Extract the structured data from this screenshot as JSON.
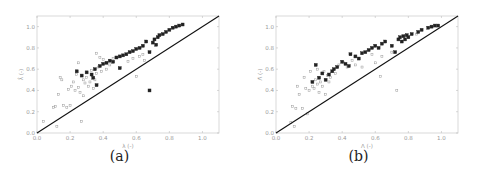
{
  "chart_data": [
    {
      "type": "scatter",
      "panel": "a",
      "caption": "(a)",
      "title": "",
      "xlabel": "λ (-)",
      "ylabel": "λ̂ (-)",
      "xlim": [
        0.0,
        1.1
      ],
      "ylim": [
        0.0,
        1.1
      ],
      "xticks": [
        "0.0",
        "0.2",
        "0.4",
        "0.6",
        "0.8",
        "1.0"
      ],
      "yticks": [
        "0.0",
        "0.2",
        "0.4",
        "0.6",
        "0.8",
        "1.0"
      ],
      "grid": false,
      "reference_line": {
        "type": "identity",
        "from": [
          0,
          0
        ],
        "to": [
          1.1,
          1.1
        ]
      },
      "series": [
        {
          "name": "dark",
          "color": "#222222",
          "points": [
            [
              0.24,
              0.58
            ],
            [
              0.27,
              0.54
            ],
            [
              0.3,
              0.57
            ],
            [
              0.33,
              0.55
            ],
            [
              0.34,
              0.52
            ],
            [
              0.35,
              0.6
            ],
            [
              0.36,
              0.45
            ],
            [
              0.38,
              0.63
            ],
            [
              0.4,
              0.65
            ],
            [
              0.42,
              0.66
            ],
            [
              0.44,
              0.68
            ],
            [
              0.46,
              0.67
            ],
            [
              0.48,
              0.71
            ],
            [
              0.5,
              0.72
            ],
            [
              0.5,
              0.61
            ],
            [
              0.52,
              0.73
            ],
            [
              0.54,
              0.74
            ],
            [
              0.56,
              0.76
            ],
            [
              0.58,
              0.77
            ],
            [
              0.6,
              0.79
            ],
            [
              0.62,
              0.8
            ],
            [
              0.64,
              0.82
            ],
            [
              0.66,
              0.86
            ],
            [
              0.68,
              0.76
            ],
            [
              0.68,
              0.4
            ],
            [
              0.7,
              0.85
            ],
            [
              0.71,
              0.88
            ],
            [
              0.72,
              0.83
            ],
            [
              0.73,
              0.9
            ],
            [
              0.74,
              0.92
            ],
            [
              0.76,
              0.93
            ],
            [
              0.78,
              0.95
            ],
            [
              0.8,
              0.97
            ],
            [
              0.82,
              0.99
            ],
            [
              0.84,
              1.0
            ],
            [
              0.86,
              1.01
            ],
            [
              0.88,
              1.02
            ]
          ]
        },
        {
          "name": "light",
          "color": "#9a9a9a",
          "points": [
            [
              0.04,
              0.11
            ],
            [
              0.1,
              0.24
            ],
            [
              0.11,
              0.25
            ],
            [
              0.12,
              0.06
            ],
            [
              0.13,
              0.36
            ],
            [
              0.14,
              0.52
            ],
            [
              0.15,
              0.5
            ],
            [
              0.16,
              0.26
            ],
            [
              0.18,
              0.24
            ],
            [
              0.19,
              0.41
            ],
            [
              0.2,
              0.26
            ],
            [
              0.21,
              0.44
            ],
            [
              0.22,
              0.48
            ],
            [
              0.23,
              0.4
            ],
            [
              0.24,
              0.55
            ],
            [
              0.25,
              0.66
            ],
            [
              0.25,
              0.43
            ],
            [
              0.26,
              0.38
            ],
            [
              0.27,
              0.11
            ],
            [
              0.28,
              0.35
            ],
            [
              0.28,
              0.5
            ],
            [
              0.29,
              0.47
            ],
            [
              0.3,
              0.52
            ],
            [
              0.31,
              0.44
            ],
            [
              0.32,
              0.48
            ],
            [
              0.33,
              0.59
            ],
            [
              0.34,
              0.42
            ],
            [
              0.35,
              0.5
            ],
            [
              0.36,
              0.56
            ],
            [
              0.36,
              0.75
            ],
            [
              0.37,
              0.62
            ],
            [
              0.38,
              0.71
            ],
            [
              0.39,
              0.58
            ],
            [
              0.4,
              0.69
            ],
            [
              0.42,
              0.6
            ],
            [
              0.44,
              0.64
            ],
            [
              0.46,
              0.7
            ],
            [
              0.55,
              0.67
            ],
            [
              0.58,
              0.7
            ],
            [
              0.6,
              0.53
            ],
            [
              0.62,
              0.72
            ],
            [
              0.64,
              0.74
            ],
            [
              0.65,
              0.68
            ]
          ]
        }
      ]
    },
    {
      "type": "scatter",
      "panel": "b",
      "caption": "(b)",
      "title": "",
      "xlabel": "Λ (-)",
      "ylabel": "Λ̂ (-)",
      "xlim": [
        0.0,
        1.1
      ],
      "ylim": [
        0.0,
        1.1
      ],
      "xticks": [
        "0.0",
        "0.2",
        "0.4",
        "0.6",
        "0.8",
        "1.0"
      ],
      "yticks": [
        "0.0",
        "0.2",
        "0.4",
        "0.6",
        "0.8",
        "1.0"
      ],
      "grid": false,
      "reference_line": {
        "type": "identity",
        "from": [
          0,
          0
        ],
        "to": [
          1.1,
          1.1
        ]
      },
      "series": [
        {
          "name": "dark",
          "color": "#222222",
          "points": [
            [
              0.22,
              0.48
            ],
            [
              0.24,
              0.64
            ],
            [
              0.26,
              0.52
            ],
            [
              0.28,
              0.56
            ],
            [
              0.3,
              0.5
            ],
            [
              0.32,
              0.55
            ],
            [
              0.34,
              0.58
            ],
            [
              0.35,
              0.6
            ],
            [
              0.37,
              0.62
            ],
            [
              0.4,
              0.67
            ],
            [
              0.42,
              0.65
            ],
            [
              0.44,
              0.63
            ],
            [
              0.45,
              0.74
            ],
            [
              0.48,
              0.72
            ],
            [
              0.5,
              0.7
            ],
            [
              0.52,
              0.75
            ],
            [
              0.54,
              0.76
            ],
            [
              0.56,
              0.78
            ],
            [
              0.58,
              0.8
            ],
            [
              0.6,
              0.82
            ],
            [
              0.62,
              0.8
            ],
            [
              0.64,
              0.84
            ],
            [
              0.66,
              0.86
            ],
            [
              0.7,
              0.82
            ],
            [
              0.72,
              0.76
            ],
            [
              0.74,
              0.88
            ],
            [
              0.75,
              0.9
            ],
            [
              0.76,
              0.86
            ],
            [
              0.77,
              0.91
            ],
            [
              0.78,
              0.88
            ],
            [
              0.79,
              0.92
            ],
            [
              0.8,
              0.9
            ],
            [
              0.82,
              0.93
            ],
            [
              0.86,
              0.95
            ],
            [
              0.88,
              0.97
            ],
            [
              0.92,
              0.99
            ],
            [
              0.94,
              1.0
            ],
            [
              0.96,
              1.01
            ],
            [
              0.98,
              1.01
            ]
          ]
        },
        {
          "name": "light",
          "color": "#9a9a9a",
          "points": [
            [
              0.09,
              0.1
            ],
            [
              0.1,
              0.25
            ],
            [
              0.11,
              0.06
            ],
            [
              0.12,
              0.23
            ],
            [
              0.13,
              0.44
            ],
            [
              0.14,
              0.36
            ],
            [
              0.16,
              0.23
            ],
            [
              0.17,
              0.52
            ],
            [
              0.18,
              0.42
            ],
            [
              0.19,
              0.18
            ],
            [
              0.2,
              0.4
            ],
            [
              0.21,
              0.58
            ],
            [
              0.22,
              0.44
            ],
            [
              0.23,
              0.42
            ],
            [
              0.24,
              0.5
            ],
            [
              0.25,
              0.46
            ],
            [
              0.25,
              0.6
            ],
            [
              0.26,
              0.38
            ],
            [
              0.27,
              0.48
            ],
            [
              0.28,
              0.44
            ],
            [
              0.29,
              0.58
            ],
            [
              0.3,
              0.36
            ],
            [
              0.31,
              0.54
            ],
            [
              0.32,
              0.48
            ],
            [
              0.33,
              0.52
            ],
            [
              0.36,
              0.56
            ],
            [
              0.38,
              0.64
            ],
            [
              0.41,
              0.66
            ],
            [
              0.43,
              0.62
            ],
            [
              0.46,
              0.68
            ],
            [
              0.48,
              0.64
            ],
            [
              0.52,
              0.62
            ],
            [
              0.58,
              0.74
            ],
            [
              0.6,
              0.66
            ],
            [
              0.63,
              0.53
            ],
            [
              0.64,
              0.72
            ],
            [
              0.7,
              0.76
            ],
            [
              0.73,
              0.4
            ],
            [
              0.85,
              0.93
            ]
          ]
        }
      ]
    }
  ],
  "panels": [
    {
      "caption": "(a)",
      "xlabel": "λ (-)",
      "ylabel": "λ̂ (-)"
    },
    {
      "caption": "(b)",
      "xlabel": "Λ (-)",
      "ylabel": "Λ̂ (-)"
    }
  ]
}
